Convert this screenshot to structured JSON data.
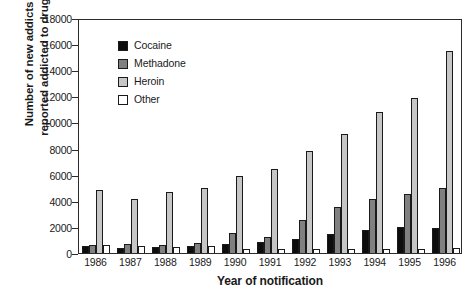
{
  "chart_data": {
    "type": "bar",
    "title": "",
    "xlabel": "Year of notification",
    "ylabel": "Number of new addicts\nreported addicted to drugs",
    "categories": [
      "1986",
      "1987",
      "1988",
      "1989",
      "1990",
      "1991",
      "1992",
      "1993",
      "1994",
      "1995",
      "1996"
    ],
    "ylim": [
      0,
      18000
    ],
    "yticks": [
      0,
      2000,
      4000,
      6000,
      8000,
      10000,
      12000,
      14000,
      16000,
      18000
    ],
    "ytick_labels": [
      "0",
      "2000",
      "4000",
      "6000",
      "8000",
      "10000",
      "12000",
      "14000",
      "16000",
      "18000"
    ],
    "grid": false,
    "legend_position": "upper-left-inside",
    "series": [
      {
        "name": "Cocaine",
        "color": "#0d0d0d",
        "values": [
          500,
          420,
          480,
          560,
          700,
          820,
          1050,
          1450,
          1800,
          2000,
          1950
        ]
      },
      {
        "name": "Methadone",
        "color": "#808080",
        "values": [
          650,
          680,
          620,
          740,
          1550,
          1250,
          2550,
          3500,
          4150,
          4550,
          4950
        ]
      },
      {
        "name": "Heroin",
        "color": "#c6c6c6",
        "values": [
          4850,
          4100,
          4650,
          4950,
          5900,
          6400,
          7800,
          9150,
          10800,
          11850,
          15500
        ]
      },
      {
        "name": "Other",
        "color": "#ffffff",
        "values": [
          620,
          540,
          470,
          540,
          340,
          340,
          330,
          330,
          330,
          330,
          420
        ]
      }
    ]
  }
}
